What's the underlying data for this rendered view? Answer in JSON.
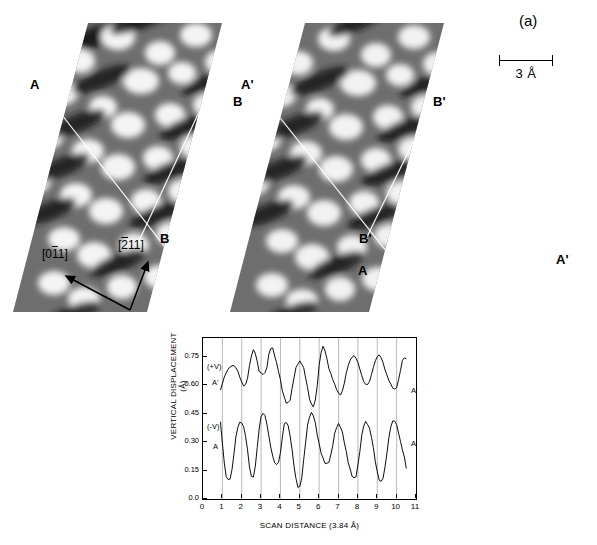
{
  "figure": {
    "panel_a_label": "(a)",
    "panel_b_label": "(b)"
  },
  "stm": {
    "scalebar": {
      "label": "3 Å",
      "length_angstrom": 3
    },
    "directions": [
      {
        "name": "direction-011",
        "label": "[011]",
        "overline_chars": "1",
        "angle_deg": 205
      },
      {
        "name": "direction-211",
        "label": "[211]",
        "overline_chars": "2",
        "angle_deg": 300
      }
    ],
    "left_panel": {
      "name": "stm-image-left",
      "markers": [
        {
          "label": "A",
          "x": 30,
          "y": 77
        },
        {
          "label": "B",
          "x": 233,
          "y": 94
        },
        {
          "label": "B",
          "x": 160,
          "y": 231
        }
      ]
    },
    "right_panel": {
      "name": "stm-image-right",
      "markers": [
        {
          "label": "A'",
          "x": 243,
          "y": 77
        },
        {
          "label": "B'",
          "x": 435,
          "y": 94
        },
        {
          "label": "B'",
          "x": 361,
          "y": 231
        },
        {
          "label": "A",
          "x": 358,
          "y": 263
        },
        {
          "label": "A'",
          "x": 558,
          "y": 252
        }
      ]
    }
  },
  "chart_data": {
    "type": "line",
    "title": "",
    "xlabel": "SCAN DISTANCE (3.84 Å)",
    "ylabel": "VERTICAL DISPLACEMENT (Å)",
    "xlim": [
      0,
      11
    ],
    "ylim": [
      0.0,
      0.85
    ],
    "xticks": [
      0,
      1,
      2,
      3,
      4,
      5,
      6,
      7,
      8,
      9,
      10,
      11
    ],
    "yticks": [
      0.0,
      0.15,
      0.3,
      0.45,
      0.6,
      0.75
    ],
    "ytick_labels": [
      "0.0",
      "0.15",
      "0.30",
      "0.45",
      "0.60",
      "0.75"
    ],
    "xtick_labels": [
      "0",
      "1",
      "2",
      "3",
      "4",
      "5",
      "6",
      "7",
      "8",
      "9",
      "10",
      "11"
    ],
    "grid": "vertical gridlines at integer scan distances 1 through 10",
    "legend_position": "inline annotations at left and right of each trace",
    "series": [
      {
        "name": "positive-bias-trace",
        "left_label": "(+V)",
        "left_sublabel": "A'",
        "right_label": "A'",
        "x": [
          0.9,
          1.0,
          1.1,
          1.2,
          1.3,
          1.4,
          1.5,
          1.6,
          1.7,
          1.8,
          1.9,
          2.0,
          2.1,
          2.2,
          2.3,
          2.4,
          2.5,
          2.6,
          2.7,
          2.8,
          2.9,
          3.0,
          3.1,
          3.2,
          3.3,
          3.4,
          3.5,
          3.6,
          3.7,
          3.8,
          3.9,
          4.0,
          4.1,
          4.2,
          4.3,
          4.4,
          4.5,
          4.6,
          4.7,
          4.8,
          4.9,
          5.0,
          5.1,
          5.2,
          5.3,
          5.4,
          5.5,
          5.6,
          5.7,
          5.8,
          5.9,
          6.0,
          6.1,
          6.2,
          6.3,
          6.4,
          6.5,
          6.6,
          6.7,
          6.8,
          6.9,
          7.0,
          7.1,
          7.2,
          7.3,
          7.4,
          7.5,
          7.6,
          7.7,
          7.8,
          7.9,
          8.0,
          8.1,
          8.2,
          8.3,
          8.4,
          8.5,
          8.6,
          8.7,
          8.8,
          8.9,
          9.0,
          9.1,
          9.2,
          9.3,
          9.4,
          9.5,
          9.6,
          9.7,
          9.8,
          9.9,
          10.0,
          10.1,
          10.2,
          10.3,
          10.4,
          10.5
        ],
        "y": [
          0.575,
          0.605,
          0.64,
          0.665,
          0.69,
          0.7,
          0.705,
          0.7,
          0.69,
          0.672,
          0.648,
          0.62,
          0.6,
          0.6,
          0.635,
          0.7,
          0.76,
          0.79,
          0.775,
          0.72,
          0.672,
          0.66,
          0.662,
          0.668,
          0.7,
          0.76,
          0.795,
          0.79,
          0.76,
          0.72,
          0.68,
          0.625,
          0.57,
          0.53,
          0.51,
          0.51,
          0.53,
          0.58,
          0.64,
          0.685,
          0.715,
          0.728,
          0.72,
          0.69,
          0.64,
          0.58,
          0.53,
          0.5,
          0.495,
          0.52,
          0.6,
          0.7,
          0.775,
          0.805,
          0.79,
          0.74,
          0.69,
          0.655,
          0.63,
          0.605,
          0.585,
          0.56,
          0.55,
          0.565,
          0.61,
          0.665,
          0.71,
          0.735,
          0.75,
          0.752,
          0.74,
          0.72,
          0.69,
          0.655,
          0.62,
          0.602,
          0.6,
          0.62,
          0.66,
          0.7,
          0.73,
          0.75,
          0.755,
          0.745,
          0.72,
          0.688,
          0.655,
          0.625,
          0.6,
          0.585,
          0.58,
          0.595,
          0.63,
          0.68,
          0.725,
          0.745,
          0.738
        ]
      },
      {
        "name": "negative-bias-trace",
        "left_label": "(-V)",
        "left_sublabel": "A",
        "right_label": "A",
        "x": [
          0.9,
          1.0,
          1.1,
          1.2,
          1.3,
          1.4,
          1.5,
          1.6,
          1.7,
          1.8,
          1.9,
          2.0,
          2.1,
          2.2,
          2.3,
          2.4,
          2.5,
          2.6,
          2.7,
          2.8,
          2.9,
          3.0,
          3.1,
          3.2,
          3.3,
          3.4,
          3.5,
          3.6,
          3.7,
          3.8,
          3.9,
          4.0,
          4.1,
          4.2,
          4.3,
          4.4,
          4.5,
          4.6,
          4.7,
          4.8,
          4.9,
          5.0,
          5.1,
          5.2,
          5.3,
          5.4,
          5.5,
          5.6,
          5.7,
          5.8,
          5.9,
          6.0,
          6.1,
          6.2,
          6.3,
          6.4,
          6.5,
          6.6,
          6.7,
          6.8,
          6.9,
          7.0,
          7.1,
          7.2,
          7.3,
          7.4,
          7.5,
          7.6,
          7.7,
          7.8,
          7.9,
          8.0,
          8.1,
          8.2,
          8.3,
          8.4,
          8.5,
          8.6,
          8.7,
          8.8,
          8.9,
          9.0,
          9.1,
          9.2,
          9.3,
          9.4,
          9.5,
          9.6,
          9.7,
          9.8,
          9.9,
          10.0,
          10.1,
          10.2,
          10.3,
          10.4,
          10.5
        ],
        "y": [
          0.4,
          0.3,
          0.19,
          0.125,
          0.1,
          0.105,
          0.15,
          0.24,
          0.33,
          0.385,
          0.405,
          0.4,
          0.375,
          0.33,
          0.26,
          0.175,
          0.12,
          0.115,
          0.165,
          0.27,
          0.37,
          0.44,
          0.455,
          0.44,
          0.39,
          0.33,
          0.275,
          0.23,
          0.195,
          0.18,
          0.19,
          0.24,
          0.33,
          0.4,
          0.41,
          0.385,
          0.33,
          0.255,
          0.175,
          0.11,
          0.068,
          0.065,
          0.11,
          0.2,
          0.3,
          0.39,
          0.44,
          0.455,
          0.44,
          0.395,
          0.34,
          0.29,
          0.25,
          0.215,
          0.19,
          0.18,
          0.195,
          0.23,
          0.29,
          0.345,
          0.38,
          0.39,
          0.38,
          0.35,
          0.305,
          0.25,
          0.195,
          0.15,
          0.12,
          0.108,
          0.125,
          0.18,
          0.255,
          0.33,
          0.385,
          0.405,
          0.4,
          0.375,
          0.33,
          0.265,
          0.195,
          0.14,
          0.105,
          0.095,
          0.115,
          0.165,
          0.24,
          0.32,
          0.385,
          0.415,
          0.415,
          0.39,
          0.345,
          0.3,
          0.26,
          0.225,
          0.165
        ]
      }
    ]
  }
}
